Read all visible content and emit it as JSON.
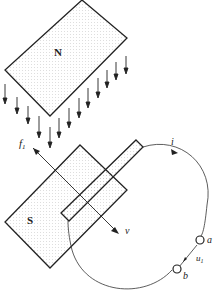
{
  "diagram": {
    "title": "",
    "magnet_north_label": "N",
    "magnet_south_label": "S",
    "force_label": "f",
    "force_subscript": "1",
    "velocity_label": "v",
    "current_label": "i",
    "terminal_a_label": "a",
    "terminal_b_label": "b",
    "voltage_label": "u",
    "voltage_subscript": "1",
    "colors": {
      "stroke": "#222222",
      "fill_dots": "#bbbbbb",
      "background": "#ffffff"
    },
    "field_arrows_count": 14
  }
}
